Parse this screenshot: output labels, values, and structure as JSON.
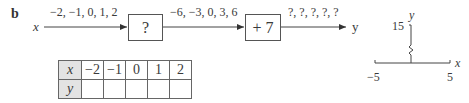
{
  "part_label": "b",
  "flow": {
    "input_var": "x",
    "output_var": "y",
    "input_values": "−2, −1, 0, 1, 2",
    "middle_values": "−6, −3, 0, 3, 6",
    "output_values": "?, ?, ?, ?, ?",
    "box1_label": "?",
    "box2_label": "+ 7"
  },
  "table": {
    "row_x_label": "x",
    "row_y_label": "y",
    "x_values": [
      "−2",
      "−1",
      "0",
      "1",
      "2"
    ],
    "y_values": [
      "",
      "",
      "",
      "",
      ""
    ]
  },
  "axes": {
    "x_label": "x",
    "y_label": "y",
    "x_min_label": "−5",
    "x_max_label": "5",
    "y_max_label": "15"
  },
  "colors": {
    "line": "#444444",
    "header_fill": "#e3e3e3"
  }
}
